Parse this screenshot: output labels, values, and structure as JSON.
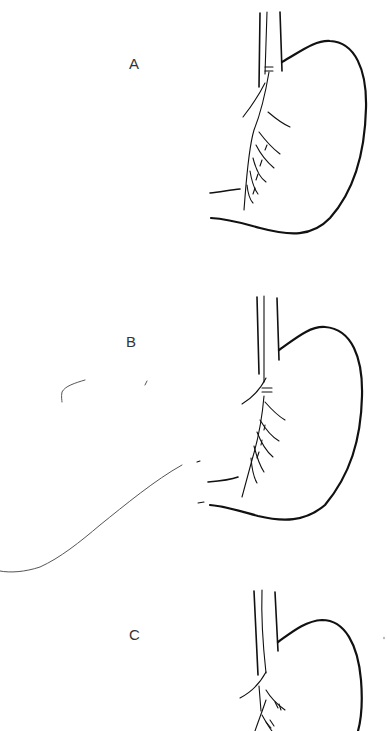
{
  "figure": {
    "panels": [
      {
        "label": "A",
        "description": "Stomach with esophagus and vagal nerve branches along the lesser curvature; ligature on the nerve trunk"
      },
      {
        "label": "B",
        "description": "Stomach with vagal branches; additional curved line extending to the lower left"
      },
      {
        "label": "C",
        "description": "Stomach with vagal branches divided along the lesser curvature (partially cropped)"
      }
    ]
  }
}
